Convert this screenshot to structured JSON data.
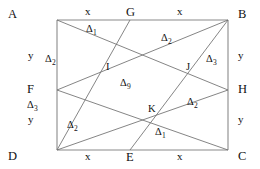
{
  "figure": {
    "stroke_color": "#6f6f6f",
    "outline_color": "#8a8a8a",
    "text_color": "#111111",
    "background": "#ffffff",
    "vertices": [
      {
        "id": "A",
        "label": "A",
        "x": 57,
        "y": 20
      },
      {
        "id": "B",
        "label": "B",
        "x": 228,
        "y": 20
      },
      {
        "id": "C",
        "label": "C",
        "x": 228,
        "y": 150
      },
      {
        "id": "D",
        "label": "D",
        "x": 57,
        "y": 150
      }
    ],
    "midpoints": [
      {
        "id": "G",
        "label": "G",
        "x": 130,
        "y": 20,
        "on": "AB"
      },
      {
        "id": "E",
        "label": "E",
        "x": 130,
        "y": 150,
        "on": "DC"
      },
      {
        "id": "F",
        "label": "F",
        "x": 57,
        "y": 90,
        "on": "AD"
      },
      {
        "id": "H",
        "label": "H",
        "x": 228,
        "y": 90,
        "on": "BC"
      }
    ],
    "intersections": [
      {
        "id": "I",
        "label": "I",
        "x": 110,
        "y": 66
      },
      {
        "id": "J",
        "label": "J",
        "x": 190,
        "y": 70
      },
      {
        "id": "K",
        "label": "K",
        "x": 152,
        "y": 112
      }
    ],
    "segments": [
      {
        "id": "AB",
        "from": "A",
        "to": "B",
        "kind": "outline"
      },
      {
        "id": "BC",
        "from": "B",
        "to": "C",
        "kind": "outline"
      },
      {
        "id": "CD",
        "from": "C",
        "to": "D",
        "kind": "outline"
      },
      {
        "id": "DA",
        "from": "D",
        "to": "A",
        "kind": "outline"
      },
      {
        "id": "AH",
        "from": "A",
        "to": "H",
        "kind": "cevian"
      },
      {
        "id": "FB",
        "from": "F",
        "to": "B",
        "kind": "cevian"
      },
      {
        "id": "GD",
        "from": "G",
        "to": "D",
        "kind": "cevian"
      },
      {
        "id": "EB",
        "from": "E",
        "to": "B",
        "kind": "cevian"
      },
      {
        "id": "FC",
        "from": "F",
        "to": "C",
        "kind": "cevian"
      },
      {
        "id": "DH",
        "from": "D",
        "to": "H",
        "kind": "cevian"
      }
    ],
    "side_labels": [
      {
        "id": "ab-left-x",
        "text": "x",
        "x": 88,
        "y": 12
      },
      {
        "id": "ab-right-x",
        "text": "x",
        "x": 180,
        "y": 12
      },
      {
        "id": "dc-left-x",
        "text": "x",
        "x": 88,
        "y": 154
      },
      {
        "id": "dc-right-x",
        "text": "x",
        "x": 180,
        "y": 154
      },
      {
        "id": "ad-top-y",
        "text": "y",
        "x": 30,
        "y": 55
      },
      {
        "id": "ad-bottom-y",
        "text": "y",
        "x": 30,
        "y": 118
      },
      {
        "id": "bc-top-y",
        "text": "y",
        "x": 240,
        "y": 55
      },
      {
        "id": "bc-bottom-y",
        "text": "y",
        "x": 240,
        "y": 118
      }
    ],
    "regions": [
      {
        "id": "r-top-delta1",
        "symbol": "Δ",
        "index": "1",
        "x": 91,
        "y": 28
      },
      {
        "id": "r-topright-d2",
        "symbol": "Δ",
        "index": "2",
        "x": 166,
        "y": 37
      },
      {
        "id": "r-left-d2",
        "symbol": "Δ",
        "index": "2",
        "x": 50,
        "y": 58
      },
      {
        "id": "r-right-d3",
        "symbol": "Δ",
        "index": "3",
        "x": 211,
        "y": 58
      },
      {
        "id": "r-center-d9",
        "symbol": "Δ",
        "index": "9",
        "x": 125,
        "y": 82
      },
      {
        "id": "r-midright-d2",
        "symbol": "Δ",
        "index": "2",
        "x": 192,
        "y": 101
      },
      {
        "id": "r-lowleft-d3",
        "symbol": "Δ",
        "index": "3",
        "x": 32,
        "y": 104
      },
      {
        "id": "r-bottom-d2",
        "symbol": "Δ",
        "index": "2",
        "x": 72,
        "y": 124
      },
      {
        "id": "r-lowright-d1",
        "symbol": "Δ",
        "index": "1",
        "x": 160,
        "y": 131
      }
    ]
  }
}
